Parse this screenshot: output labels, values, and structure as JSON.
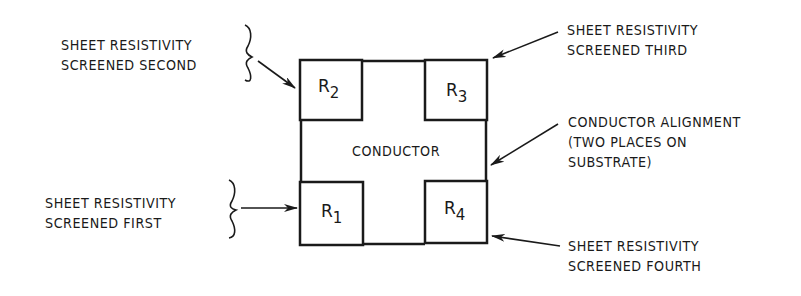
{
  "diagram": {
    "center_label": "CONDUCTOR",
    "resistors": [
      {
        "id": "R1",
        "base": "R",
        "sub": "1",
        "position": "bottom-left"
      },
      {
        "id": "R2",
        "base": "R",
        "sub": "2",
        "position": "top-left"
      },
      {
        "id": "R3",
        "base": "R",
        "sub": "3",
        "position": "top-right"
      },
      {
        "id": "R4",
        "base": "R",
        "sub": "4",
        "position": "bottom-right"
      }
    ],
    "callouts": {
      "second": {
        "line1": "SHEET RESISTIVITY",
        "line2": "SCREENED SECOND"
      },
      "first": {
        "line1": "SHEET RESISTIVITY",
        "line2": "SCREENED FIRST"
      },
      "third": {
        "line1": "SHEET RESISTIVITY",
        "line2": "SCREENED THIRD"
      },
      "alignment": {
        "line1": "CONDUCTOR ALIGNMENT",
        "line2": "(TWO PLACES ON",
        "line3": "SUBSTRATE)"
      },
      "fourth": {
        "line1": "SHEET RESISTIVITY",
        "line2": "SCREENED FOURTH"
      }
    }
  }
}
